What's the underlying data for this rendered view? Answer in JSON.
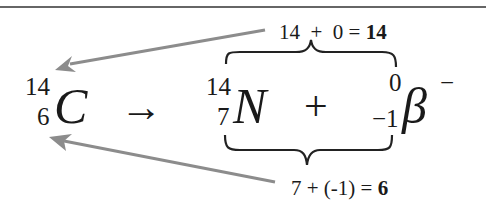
{
  "equation": {
    "reactant": {
      "symbol": "C",
      "mass_number": "14",
      "atomic_number": "6"
    },
    "arrow": "→",
    "product1": {
      "symbol": "N",
      "mass_number": "14",
      "atomic_number": "7"
    },
    "plus": "+",
    "product2": {
      "symbol": "β",
      "charge": "−",
      "mass_number": "0",
      "atomic_number": "−1"
    }
  },
  "annotations": {
    "mass_sum": {
      "expression": "14  +  0 = ",
      "result": "14"
    },
    "atomic_sum": {
      "expression": "7 + (-1) = ",
      "result": "6"
    }
  },
  "colors": {
    "text": "#1a1a1a",
    "arrow": "#8c8c8c",
    "rule": "#333333",
    "brace": "#222222"
  }
}
